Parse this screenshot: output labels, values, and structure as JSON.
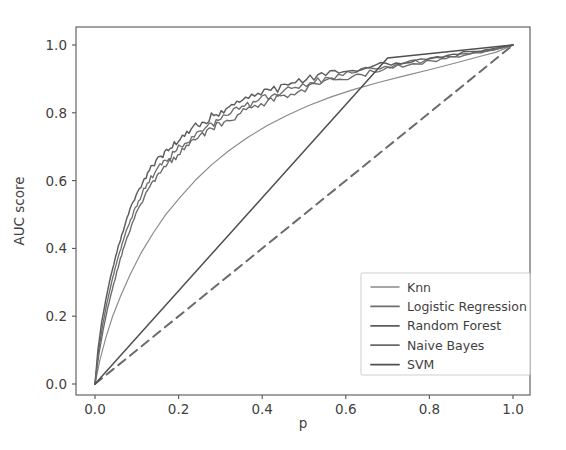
{
  "chart_data": {
    "type": "line",
    "title": "",
    "xlabel": "p",
    "ylabel": "AUC score",
    "xlim": [
      -0.045,
      1.045
    ],
    "ylim": [
      -0.045,
      1.045
    ],
    "xticks": [
      "0.0",
      "0.2",
      "0.4",
      "0.6",
      "0.8",
      "1.0"
    ],
    "xtick_values": [
      0.0,
      0.2,
      0.4,
      0.6,
      0.8,
      1.0
    ],
    "yticks": [
      "0.0",
      "0.2",
      "0.4",
      "0.6",
      "0.8",
      "1.0"
    ],
    "ytick_values": [
      0.0,
      0.2,
      0.4,
      0.6,
      0.8,
      1.0
    ],
    "grid": false,
    "legend_position": "lower right",
    "legend_entries": [
      "Knn",
      "Logistic Regression",
      "Random Forest",
      "Naive Bayes",
      "SVM"
    ],
    "colors": {
      "knn": "#8a8a8a",
      "logistic_regression": "#6f6f6f",
      "random_forest": "#5d5d5d",
      "naive_bayes": "#6a6a6a",
      "svm": "#4f4f4f",
      "chance_line": "#6b6b6b",
      "axis": "#555555",
      "text": "#3f3f3f",
      "background": "#ffffff"
    },
    "reference_line": {
      "name": "chance",
      "style": "dashed",
      "x": [
        0.0,
        1.0
      ],
      "y": [
        0.0,
        1.0
      ]
    },
    "series": [
      {
        "name": "Knn",
        "style": "solid",
        "color": "#8a8a8a",
        "x": [
          0.0,
          0.012,
          0.026,
          0.042,
          0.062,
          0.085,
          0.11,
          0.14,
          0.17,
          0.205,
          0.24,
          0.28,
          0.32,
          0.365,
          0.41,
          0.46,
          0.51,
          0.565,
          0.62,
          0.68,
          0.74,
          0.8,
          0.86,
          0.92,
          0.96,
          1.0
        ],
        "y": [
          0.0,
          0.072,
          0.137,
          0.199,
          0.262,
          0.325,
          0.386,
          0.447,
          0.501,
          0.553,
          0.601,
          0.648,
          0.688,
          0.727,
          0.761,
          0.793,
          0.821,
          0.847,
          0.869,
          0.89,
          0.909,
          0.927,
          0.946,
          0.966,
          0.979,
          1.0
        ]
      },
      {
        "name": "Logistic Regression",
        "style": "solid",
        "color": "#6f6f6f",
        "x": [
          0.0,
          0.008,
          0.018,
          0.028,
          0.04,
          0.053,
          0.068,
          0.085,
          0.104,
          0.125,
          0.147,
          0.168,
          0.19,
          0.215,
          0.243,
          0.268,
          0.295,
          0.325,
          0.358,
          0.392,
          0.43,
          0.47,
          0.515,
          0.56,
          0.615,
          0.67,
          0.73,
          0.79,
          0.85,
          0.91,
          0.96,
          1.0
        ],
        "y": [
          0.0,
          0.093,
          0.172,
          0.236,
          0.301,
          0.364,
          0.425,
          0.485,
          0.54,
          0.592,
          0.632,
          0.66,
          0.684,
          0.71,
          0.742,
          0.76,
          0.778,
          0.799,
          0.82,
          0.838,
          0.856,
          0.872,
          0.889,
          0.903,
          0.917,
          0.93,
          0.943,
          0.955,
          0.966,
          0.978,
          0.987,
          1.0
        ]
      },
      {
        "name": "Random Forest",
        "style": "solid",
        "color": "#5d5d5d",
        "x": [
          0.0,
          0.007,
          0.016,
          0.026,
          0.037,
          0.05,
          0.064,
          0.08,
          0.098,
          0.118,
          0.138,
          0.158,
          0.18,
          0.204,
          0.23,
          0.256,
          0.284,
          0.314,
          0.346,
          0.382,
          0.42,
          0.462,
          0.505,
          0.552,
          0.605,
          0.66,
          0.72,
          0.78,
          0.845,
          0.905,
          0.955,
          1.0
        ],
        "y": [
          0.0,
          0.101,
          0.183,
          0.25,
          0.315,
          0.379,
          0.441,
          0.5,
          0.556,
          0.606,
          0.645,
          0.672,
          0.695,
          0.722,
          0.752,
          0.772,
          0.792,
          0.812,
          0.831,
          0.849,
          0.866,
          0.882,
          0.897,
          0.91,
          0.923,
          0.935,
          0.947,
          0.959,
          0.97,
          0.981,
          0.99,
          1.0
        ]
      },
      {
        "name": "Naive Bayes",
        "style": "solid",
        "color": "#6a6a6a",
        "x": [
          0.0,
          0.009,
          0.02,
          0.031,
          0.044,
          0.058,
          0.073,
          0.09,
          0.11,
          0.131,
          0.152,
          0.174,
          0.198,
          0.224,
          0.251,
          0.279,
          0.309,
          0.341,
          0.375,
          0.412,
          0.452,
          0.494,
          0.538,
          0.585,
          0.636,
          0.69,
          0.748,
          0.806,
          0.862,
          0.915,
          0.96,
          1.0
        ],
        "y": [
          0.0,
          0.086,
          0.163,
          0.228,
          0.293,
          0.357,
          0.418,
          0.477,
          0.531,
          0.582,
          0.622,
          0.651,
          0.676,
          0.703,
          0.734,
          0.754,
          0.773,
          0.794,
          0.815,
          0.834,
          0.852,
          0.868,
          0.884,
          0.899,
          0.913,
          0.927,
          0.94,
          0.953,
          0.965,
          0.977,
          0.987,
          1.0
        ]
      },
      {
        "name": "SVM",
        "style": "solid",
        "color": "#4f4f4f",
        "x": [
          0.0,
          0.7,
          1.0
        ],
        "y": [
          0.0,
          0.962,
          1.0
        ]
      }
    ]
  },
  "axes": {
    "ylabel": "AUC score",
    "xlabel": "p"
  },
  "legend": {
    "items": [
      {
        "label": "Knn"
      },
      {
        "label": "Logistic Regression"
      },
      {
        "label": "Random Forest"
      },
      {
        "label": "Naive Bayes"
      },
      {
        "label": "SVM"
      }
    ]
  }
}
